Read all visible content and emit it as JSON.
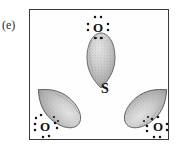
{
  "figure": {
    "part_label": "(e)",
    "caption_visible": false,
    "frame": {
      "x": 29,
      "y": 9,
      "width": 140,
      "height": 131,
      "border_color": "#3a3a3a"
    },
    "central_atom": {
      "symbol": "S",
      "name": "sulfur-atom-label",
      "x": 105,
      "y": 92
    },
    "terminal_atoms": [
      {
        "symbol": "O",
        "name": "oxygen-atom-top",
        "x": 98,
        "y": 28,
        "lone_pair_dots": 8
      },
      {
        "symbol": "O",
        "name": "oxygen-atom-bottom-left",
        "x": 45,
        "y": 127,
        "lone_pair_dots": 8
      },
      {
        "symbol": "O",
        "name": "oxygen-atom-bottom-right",
        "x": 158,
        "y": 127,
        "lone_pair_dots": 8
      }
    ],
    "lobes": [
      {
        "name": "bonding-lobe-top",
        "rotation_deg": 0,
        "apex_x": 105,
        "apex_y": 86
      },
      {
        "name": "bonding-lobe-bottom-left",
        "rotation_deg": 130,
        "apex_x": 101,
        "apex_y": 92
      },
      {
        "name": "bonding-lobe-bottom-right",
        "rotation_deg": 230,
        "apex_x": 109,
        "apex_y": 92
      }
    ],
    "colors": {
      "lobe_fill_light": "#d5d5d5",
      "lobe_fill_mid": "#b5b5b5",
      "lobe_fill_dark": "#8e8e8e",
      "lobe_stroke": "#5a5a5a",
      "dot_color": "#141414",
      "text_color": "#111111",
      "background": "#ffffff"
    }
  }
}
